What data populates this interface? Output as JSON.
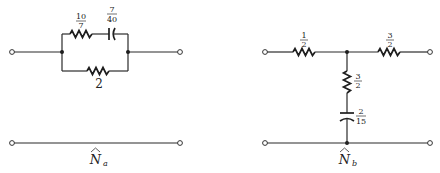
{
  "diagram": {
    "type": "circuit-schematic",
    "networks": [
      {
        "id": "Na",
        "label": "N",
        "subscript": "a",
        "hat": true,
        "components": {
          "top_resistor": {
            "type": "resistor",
            "num": "10",
            "den": "7",
            "value": "10/7"
          },
          "top_capacitor": {
            "type": "capacitor",
            "num": "7",
            "den": "40",
            "value": "7/40"
          },
          "bottom_resistor": {
            "type": "resistor",
            "label": "2",
            "value": "2"
          }
        },
        "topology": "series (10/7 resistor + 7/40 capacitor) in parallel with 2 resistor, top line; bottom line is a plain return wire"
      },
      {
        "id": "Nb",
        "label": "N",
        "subscript": "b",
        "hat": true,
        "components": {
          "left_resistor": {
            "type": "resistor",
            "num": "1",
            "den": "2",
            "value": "1/2"
          },
          "right_resistor": {
            "type": "resistor",
            "num": "3",
            "den": "2",
            "value": "3/2"
          },
          "shunt_resistor": {
            "type": "resistor",
            "num": "3",
            "den": "2",
            "value": "3/2"
          },
          "shunt_capacitor": {
            "type": "capacitor",
            "num": "2",
            "den": "15",
            "value": "2/15"
          }
        },
        "topology": "T-network: series 1/2 and 3/2 resistors, shunt branch of 3/2 resistor in series with 2/15 capacitor to return wire"
      }
    ]
  }
}
